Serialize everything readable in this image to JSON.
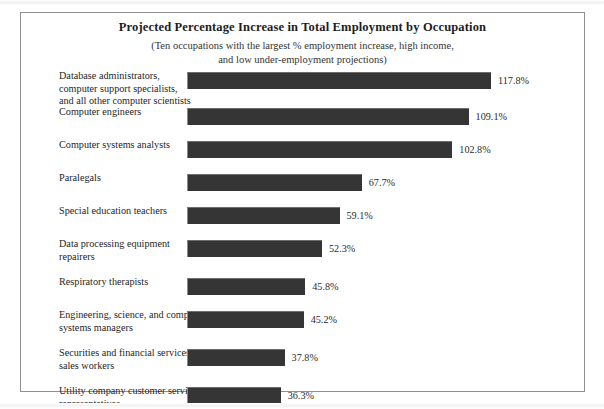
{
  "figure": {
    "title": "Projected Percentage Increase in Total Employment by Occupation",
    "subtitle_line1": "(Ten occupations with the largest % employment increase, high income,",
    "subtitle_line2": "and low under-employment projections)"
  },
  "chart_data": {
    "type": "bar",
    "orientation": "horizontal",
    "title": "Projected Percentage Increase in Total Employment by Occupation",
    "subtitle": "(Ten occupations with the largest % employment increase, high income, and low under-employment projections)",
    "xlabel": "",
    "ylabel": "",
    "xlim": [
      0,
      117.8
    ],
    "grid": false,
    "legend": false,
    "value_suffix": "%",
    "bar_color": "#353535",
    "categories": [
      "Database administrators, computer support specialists, and all other computer scientists",
      "Computer engineers",
      "Computer systems analysts",
      "Paralegals",
      "Special education teachers",
      "Data processing equipment repairers",
      "Respiratory therapists",
      "Engineering, science, and computer systems managers",
      "Securities and financial services sales workers",
      "Utility company customer service representatives"
    ],
    "values": [
      117.8,
      109.1,
      102.8,
      67.7,
      59.1,
      52.3,
      45.8,
      45.2,
      37.8,
      36.3
    ],
    "value_labels": [
      "117.8%",
      "109.1%",
      "102.8%",
      "67.7%",
      "59.1%",
      "52.3%",
      "45.8%",
      "45.2%",
      "37.8%",
      "36.3%"
    ],
    "category_lines": [
      [
        "Database administrators,",
        "computer support specialists,",
        "and all other computer scientists"
      ],
      [
        "Computer engineers"
      ],
      [
        "Computer systems analysts"
      ],
      [
        "Paralegals"
      ],
      [
        "Special education teachers"
      ],
      [
        "Data processing equipment",
        "repairers"
      ],
      [
        "Respiratory therapists"
      ],
      [
        "Engineering, science, and computer",
        "systems managers"
      ],
      [
        "Securities and financial services",
        "sales workers"
      ],
      [
        "Utility company customer service",
        "representatives"
      ]
    ]
  }
}
